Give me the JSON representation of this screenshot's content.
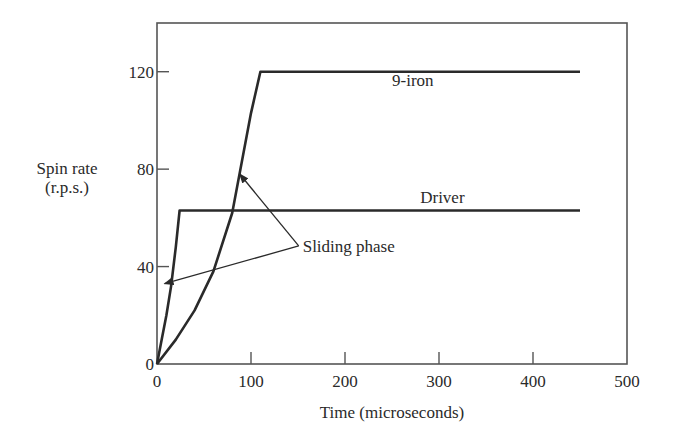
{
  "chart_data": {
    "type": "line",
    "title": "",
    "xlabel": "Time (microseconds)",
    "ylabel": [
      "Spin rate",
      "(r.p.s.)"
    ],
    "xlim": [
      0,
      500
    ],
    "ylim": [
      0,
      140
    ],
    "xticks": [
      0,
      100,
      200,
      300,
      400,
      500
    ],
    "yticks": [
      0,
      40,
      80,
      120
    ],
    "grid": false,
    "legend": "none (inline labels)",
    "series": [
      {
        "name": "9-iron",
        "x": [
          0,
          20,
          40,
          60,
          80,
          100,
          110,
          450
        ],
        "y": [
          0,
          10,
          22,
          38,
          62,
          103,
          120,
          120
        ]
      },
      {
        "name": "Driver",
        "x": [
          0,
          5,
          10,
          15,
          20,
          24,
          450
        ],
        "y": [
          0,
          10,
          20,
          32,
          48,
          63,
          63
        ]
      }
    ],
    "annotations": [
      {
        "text": "9-iron",
        "x": 250,
        "y": 114
      },
      {
        "text": "Driver",
        "x": 280,
        "y": 66
      },
      {
        "text": "Sliding phase",
        "x": 155,
        "y": 46,
        "arrows_to": [
          [
            8,
            33
          ],
          [
            88,
            78
          ]
        ]
      }
    ]
  }
}
